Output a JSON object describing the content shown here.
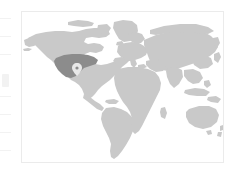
{
  "widget": {
    "name": "world-map-thumbnail",
    "type": "choropleth-locator-map",
    "projection": "equirectangular",
    "title": "",
    "caption": "",
    "frame_visible": true
  },
  "colors": {
    "background": "#ffffff",
    "frame_border": "#ebebeb",
    "land": "#c9c9c9",
    "land_highlight": "#8c8c8c",
    "marker": "#e8e8e8",
    "edge_fragment": "#f2f2f2"
  },
  "legend": {
    "visible": false,
    "entries": []
  },
  "axes": {
    "visible": false,
    "tick_labels": []
  },
  "regions": [
    {
      "name": "north-america",
      "state": "normal",
      "label": ""
    },
    {
      "name": "greenland",
      "state": "normal",
      "label": ""
    },
    {
      "name": "south-america",
      "state": "normal",
      "label": ""
    },
    {
      "name": "europe",
      "state": "normal",
      "label": ""
    },
    {
      "name": "africa",
      "state": "normal",
      "label": ""
    },
    {
      "name": "asia",
      "state": "normal",
      "label": ""
    },
    {
      "name": "australia",
      "state": "normal",
      "label": ""
    },
    {
      "name": "united-states-midwest",
      "state": "highlighted",
      "label": ""
    }
  ],
  "marker": {
    "name": "location-pin",
    "visible": true,
    "label": "",
    "region": "united-states-midwest"
  },
  "edge_fragments": {
    "visible": true,
    "count": 8,
    "description": ""
  },
  "annotations": []
}
